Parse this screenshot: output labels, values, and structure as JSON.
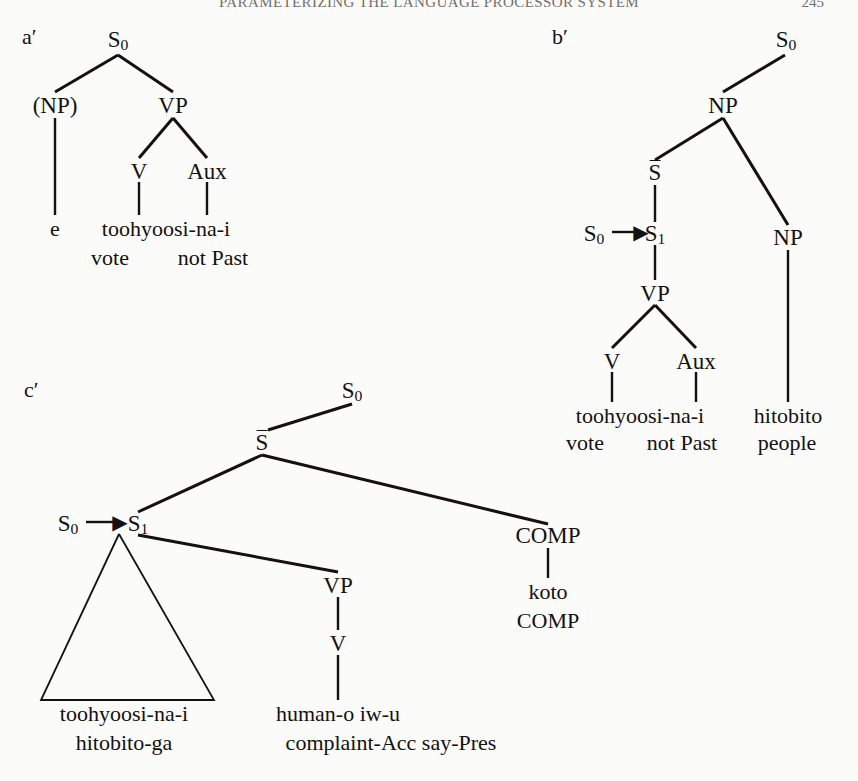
{
  "page": {
    "running_head": "PARAMETERIZING THE LANGUAGE PROCESSOR SYSTEM",
    "folio": "245",
    "background": "#fbfbfa",
    "ink": "#14110f"
  },
  "trees": {
    "a": {
      "label": "a′",
      "nodes": {
        "s0": "S₀",
        "np": "(NP)",
        "vp": "VP",
        "v": "V",
        "aux": "Aux"
      },
      "terminals": {
        "e": "e",
        "verb": "toohyoosi-na-i"
      },
      "glosses": {
        "vote": "vote",
        "notpast": "not Past"
      }
    },
    "b": {
      "label": "b′",
      "nodes": {
        "s0_top": "S₀",
        "np_top": "NP",
        "sbar": "S̄",
        "s0_src": "S₀",
        "s1": "S₁",
        "vp": "VP",
        "v": "V",
        "aux": "Aux",
        "np_right": "NP"
      },
      "terminals": {
        "verb": "toohyoosi-na-i",
        "noun": "hitobito"
      },
      "glosses": {
        "vote": "vote",
        "notpast": "not Past",
        "people": "people"
      },
      "arrow": "→"
    },
    "c": {
      "label": "c′",
      "nodes": {
        "s0_top": "S₀",
        "sbar": "S̄",
        "s0_src": "S₀",
        "s1": "S₁",
        "vp": "VP",
        "v": "V",
        "comp": "COMP"
      },
      "terminals": {
        "koto": "koto",
        "triangle_line1": "toohyoosi-na-i",
        "triangle_line2": "hitobito-ga",
        "vp_line1": "human-o iw-u"
      },
      "glosses": {
        "comp": "COMP",
        "vp_line2": "complaint-Acc say-Pres"
      },
      "arrow": "→"
    }
  }
}
